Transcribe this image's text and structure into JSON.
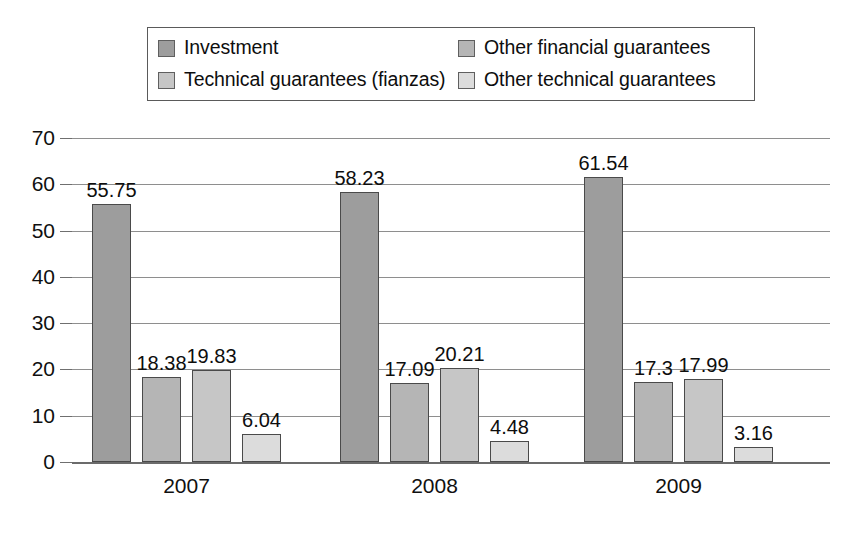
{
  "chart_data": {
    "type": "bar",
    "title": "",
    "subtitle": "",
    "xlabel": "",
    "ylabel": "",
    "categories": [
      "2007",
      "2008",
      "2009"
    ],
    "series": [
      {
        "name": "Investment",
        "color": "#9d9d9d",
        "values": [
          55.75,
          58.23,
          61.54
        ],
        "labels": [
          "55.75",
          "58.23",
          "61.54"
        ]
      },
      {
        "name": "Other financial guarantees",
        "color": "#b5b5b5",
        "values": [
          18.38,
          17.09,
          17.3
        ],
        "labels": [
          "18.38",
          "17.09",
          "17.3"
        ]
      },
      {
        "name": "Technical guarantees (fianzas)",
        "color": "#c6c6c6",
        "values": [
          19.83,
          20.21,
          17.99
        ],
        "labels": [
          "19.83",
          "20.21",
          "17.99"
        ]
      },
      {
        "name": "Other technical guarantees",
        "color": "#dcdcdc",
        "values": [
          6.04,
          4.48,
          3.16
        ],
        "labels": [
          "6.04",
          "4.48",
          "3.16"
        ]
      }
    ],
    "ylim": [
      0,
      70
    ],
    "ytick_step": 10,
    "yticks": [
      "70",
      "60",
      "50",
      "40",
      "30",
      "20",
      "10",
      "0"
    ],
    "grid": true,
    "legend_position": "top",
    "legend_order": [
      "Investment",
      "Other financial guarantees",
      "Technical guarantees (fianzas)",
      "Other technical guarantees"
    ]
  },
  "legend": {
    "entries": [
      {
        "label": "Investment",
        "swatch": "#9d9d9d"
      },
      {
        "label": "Other financial guarantees",
        "swatch": "#b5b5b5"
      },
      {
        "label": "Technical guarantees (fianzas)",
        "swatch": "#c6c6c6"
      },
      {
        "label": "Other technical guarantees",
        "swatch": "#dcdcdc"
      }
    ]
  },
  "axes": {
    "y_tick_labels": [
      "70",
      "60",
      "50",
      "40",
      "30",
      "20",
      "10",
      "0"
    ],
    "x_tick_labels": [
      "2007",
      "2008",
      "2009"
    ]
  }
}
